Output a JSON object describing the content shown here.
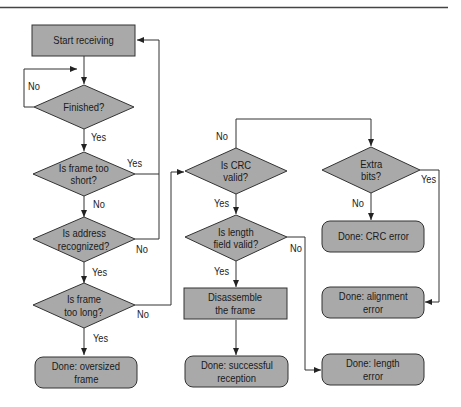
{
  "diagram": {
    "type": "flowchart",
    "colors": {
      "fill": "#a9a9a9",
      "stroke": "#333333",
      "line": "#333333",
      "background": "#ffffff"
    },
    "nodes": {
      "start": {
        "shape": "rectangle",
        "lines": [
          "Start receiving"
        ]
      },
      "finished": {
        "shape": "diamond",
        "lines": [
          "Finished?"
        ]
      },
      "too_short": {
        "shape": "diamond",
        "lines": [
          "Is frame too",
          "short?"
        ]
      },
      "address": {
        "shape": "diamond",
        "lines": [
          "Is address",
          "recognized?"
        ]
      },
      "too_long": {
        "shape": "diamond",
        "lines": [
          "Is frame",
          "too long?"
        ]
      },
      "oversized": {
        "shape": "rounded-rectangle",
        "lines": [
          "Done: oversized",
          "frame"
        ]
      },
      "crc_valid": {
        "shape": "diamond",
        "lines": [
          "Is CRC",
          "valid?"
        ]
      },
      "length_valid": {
        "shape": "diamond",
        "lines": [
          "Is length",
          "field valid?"
        ]
      },
      "disassemble": {
        "shape": "rectangle",
        "lines": [
          "Disassemble",
          "the frame"
        ]
      },
      "success": {
        "shape": "rounded-rectangle",
        "lines": [
          "Done: successful",
          "reception"
        ]
      },
      "extra_bits": {
        "shape": "diamond",
        "lines": [
          "Extra",
          "bits?"
        ]
      },
      "crc_error": {
        "shape": "rounded-rectangle",
        "lines": [
          "Done: CRC error"
        ]
      },
      "alignment_error": {
        "shape": "rounded-rectangle",
        "lines": [
          "Done: alignment",
          "error"
        ]
      },
      "length_error": {
        "shape": "rounded-rectangle",
        "lines": [
          "Done: length",
          "error"
        ]
      }
    },
    "edges": [
      {
        "from": "start",
        "to": "finished",
        "label": ""
      },
      {
        "from": "finished",
        "to": "finished",
        "label": "No"
      },
      {
        "from": "finished",
        "to": "too_short",
        "label": "Yes"
      },
      {
        "from": "too_short",
        "to": "start",
        "label": "Yes"
      },
      {
        "from": "too_short",
        "to": "address",
        "label": "No"
      },
      {
        "from": "address",
        "to": "start",
        "label": "No"
      },
      {
        "from": "address",
        "to": "too_long",
        "label": "Yes"
      },
      {
        "from": "too_long",
        "to": "oversized",
        "label": "Yes"
      },
      {
        "from": "too_long",
        "to": "crc_valid",
        "label": "No"
      },
      {
        "from": "crc_valid",
        "to": "length_valid",
        "label": "Yes"
      },
      {
        "from": "crc_valid",
        "to": "extra_bits",
        "label": "No"
      },
      {
        "from": "length_valid",
        "to": "disassemble",
        "label": "Yes"
      },
      {
        "from": "length_valid",
        "to": "length_error",
        "label": "No"
      },
      {
        "from": "disassemble",
        "to": "success",
        "label": ""
      },
      {
        "from": "extra_bits",
        "to": "crc_error",
        "label": "No"
      },
      {
        "from": "extra_bits",
        "to": "alignment_error",
        "label": "Yes"
      }
    ],
    "edge_labels": {
      "finished_no": "No",
      "finished_yes": "Yes",
      "too_short_yes": "Yes",
      "too_short_no": "No",
      "address_no": "No",
      "address_yes": "Yes",
      "too_long_no": "No",
      "too_long_yes": "Yes",
      "crc_no": "No",
      "crc_yes": "Yes",
      "length_no": "No",
      "length_yes": "Yes",
      "extra_no": "No",
      "extra_yes": "Yes"
    }
  }
}
